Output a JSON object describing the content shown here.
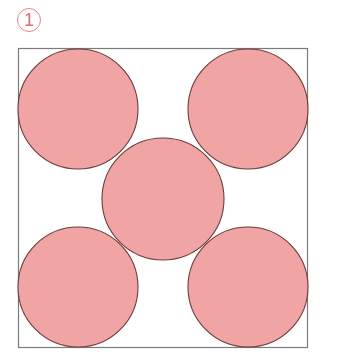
{
  "figure": {
    "label": "1",
    "colors": {
      "circle_fill": "#f1a4a4",
      "circle_stroke": "#6b3b3b",
      "square_stroke": "#7a7a7a",
      "label_color": "#e46f6f"
    },
    "square": {
      "x": 18.5,
      "y": 48.5,
      "width": 289,
      "height": 299
    },
    "circles": [
      {
        "name": "top-left",
        "cx": 78,
        "cy": 109,
        "r": 60
      },
      {
        "name": "top-right",
        "cx": 248,
        "cy": 109,
        "r": 60
      },
      {
        "name": "center",
        "cx": 163,
        "cy": 199,
        "r": 61
      },
      {
        "name": "bottom-left",
        "cx": 78,
        "cy": 287,
        "r": 60
      },
      {
        "name": "bottom-right",
        "cx": 248,
        "cy": 287,
        "r": 60
      }
    ]
  }
}
